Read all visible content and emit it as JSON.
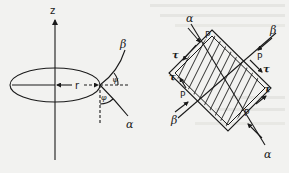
{
  "figure": {
    "left_panel": {
      "axis_label": "z",
      "radius_label": "r",
      "curve_upper_label": "β",
      "curve_lower_label": "α",
      "angle_upper_label": "ψ",
      "angle_lower_label": "φ"
    },
    "right_panel": {
      "line_alpha_top_label": "α",
      "line_alpha_bottom_label": "α",
      "line_beta_top_label": "β",
      "line_beta_bottom_label": "β",
      "pressure_labels": [
        "P",
        "P",
        "P",
        "P"
      ],
      "shear_labels": [
        "τ",
        "τ",
        "τ",
        "τ"
      ]
    }
  },
  "colors": {
    "background": "#f2f2f0",
    "ink": "#1a1a1a",
    "bleed_through": "#d6d6d2"
  }
}
